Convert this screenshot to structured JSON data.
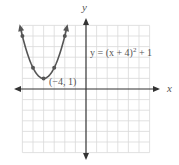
{
  "chart_data": {
    "type": "line",
    "title": "",
    "xlabel": "x",
    "ylabel": "y",
    "xlim": [
      -6,
      6
    ],
    "ylim": [
      -6,
      6
    ],
    "grid": true,
    "equation_label": "y = (x + 4)² + 1",
    "vertex_label": "(−4, 1)",
    "series": [
      {
        "name": "y = (x + 4)^2 + 1",
        "x": [
          -6.2,
          -6,
          -5,
          -4,
          -3,
          -2,
          -1.8
        ],
        "y": [
          5.84,
          5,
          2,
          1,
          2,
          5,
          5.84
        ]
      }
    ],
    "marked_points": [
      [
        -6,
        5
      ],
      [
        -5,
        2
      ],
      [
        -4,
        1
      ],
      [
        -3,
        2
      ],
      [
        -2,
        5
      ]
    ],
    "colors": {
      "curve": "#555555",
      "grid": "#d8d8d8",
      "axis": "#333333"
    }
  },
  "labels": {
    "x_axis": "x",
    "y_axis": "y",
    "equation": "y = (x + 4)",
    "equation_exp": "2",
    "equation_tail": " + 1",
    "vertex": "(−4, 1)"
  }
}
